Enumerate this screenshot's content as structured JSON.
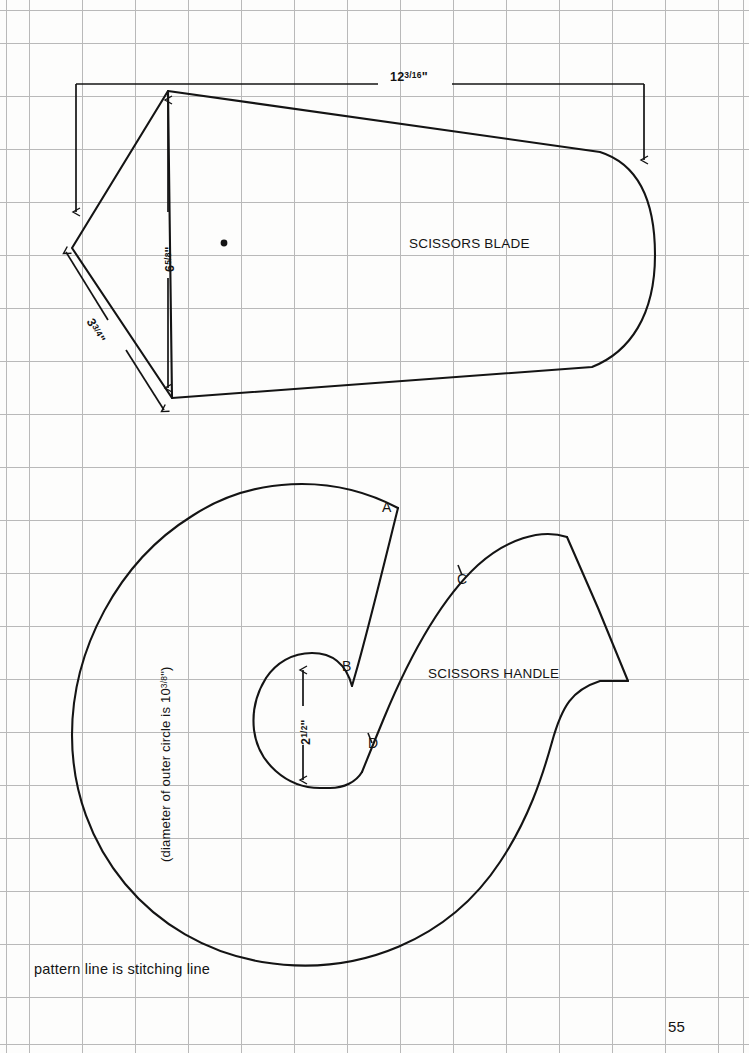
{
  "page": {
    "number": "55",
    "background_color": "#fdfdfc",
    "grid_color": "#b9b9b9",
    "ink_color": "#141414",
    "grid_spacing_px": 53
  },
  "parts": [
    {
      "id": "scissors-blade",
      "label": "SCISSORS BLADE",
      "dimensions": [
        {
          "id": "blade-length",
          "value": "12",
          "fraction_num": "3",
          "fraction_den": "16",
          "unit": "\"",
          "orientation": "horizontal"
        },
        {
          "id": "blade-height",
          "value": "6",
          "fraction_num": "5",
          "fraction_den": "8",
          "unit": "\"",
          "orientation": "vertical"
        },
        {
          "id": "blade-diagonal",
          "value": "3",
          "fraction_num": "3",
          "fraction_den": "4",
          "unit": "\"",
          "orientation": "diagonal"
        }
      ]
    },
    {
      "id": "scissors-handle",
      "label": "SCISSORS HANDLE",
      "points": [
        "A",
        "B",
        "C",
        "D"
      ],
      "dimensions": [
        {
          "id": "inner-circle",
          "value": "2",
          "fraction_num": "1",
          "fraction_den": "2",
          "unit": "\"",
          "orientation": "vertical"
        }
      ],
      "outer_circle_note": {
        "prefix": "(diameter of outer circle is 10",
        "fraction_num": "3",
        "fraction_den": "8",
        "suffix": "\")"
      }
    }
  ],
  "notes": {
    "stitching": "pattern line is stitching line"
  }
}
